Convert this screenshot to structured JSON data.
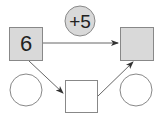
{
  "diagram": {
    "operator": {
      "label": "+5",
      "fill": "#d9d9d9"
    },
    "input_box": {
      "value": "6",
      "fill": "#d9d9d9"
    },
    "output_box": {
      "value": "",
      "fill": "#d9d9d9"
    },
    "middle_box": {
      "value": "",
      "fill": "#ffffff"
    },
    "left_circle": {
      "value": ""
    },
    "right_circle": {
      "value": ""
    },
    "stroke_color": "#777777",
    "arrow_color": "#333333"
  }
}
